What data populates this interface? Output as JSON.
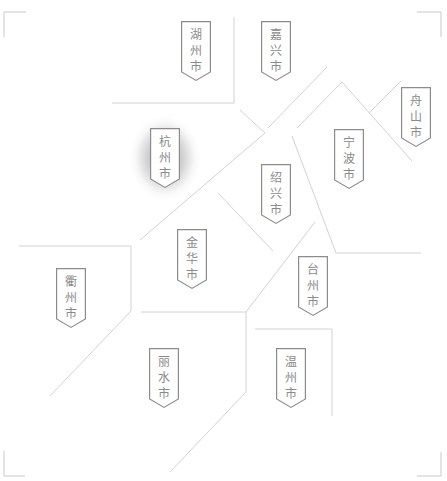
{
  "map": {
    "region": "浙江省",
    "line_color": "#d2d2d2",
    "marker_border_color": "#8c8c8c",
    "label_color": "#8a8a8a",
    "highlighted_city": "杭州市",
    "cities": [
      {
        "id": "huzhou",
        "name": "湖州市",
        "chars": [
          "湖",
          "州",
          "市"
        ],
        "x": 181,
        "y": 21,
        "highlight": false
      },
      {
        "id": "jiaxing",
        "name": "嘉兴市",
        "chars": [
          "嘉",
          "兴",
          "市"
        ],
        "x": 261,
        "y": 21,
        "highlight": false
      },
      {
        "id": "zhoushan",
        "name": "舟山市",
        "chars": [
          "舟",
          "山",
          "市"
        ],
        "x": 401,
        "y": 87,
        "highlight": false
      },
      {
        "id": "hangzhou",
        "name": "杭州市",
        "chars": [
          "杭",
          "州",
          "市"
        ],
        "x": 150,
        "y": 128,
        "highlight": true
      },
      {
        "id": "ningbo",
        "name": "宁波市",
        "chars": [
          "宁",
          "波",
          "市"
        ],
        "x": 334,
        "y": 129,
        "highlight": false
      },
      {
        "id": "shaoxing",
        "name": "绍兴市",
        "chars": [
          "绍",
          "兴",
          "市"
        ],
        "x": 261,
        "y": 164,
        "highlight": false
      },
      {
        "id": "jinhua",
        "name": "金华市",
        "chars": [
          "金",
          "华",
          "市"
        ],
        "x": 177,
        "y": 229,
        "highlight": false
      },
      {
        "id": "taizhou",
        "name": "台州市",
        "chars": [
          "台",
          "州",
          "市"
        ],
        "x": 298,
        "y": 256,
        "highlight": false
      },
      {
        "id": "quzhou",
        "name": "衢州市",
        "chars": [
          "衢",
          "州",
          "市"
        ],
        "x": 56,
        "y": 268,
        "highlight": false
      },
      {
        "id": "lishui",
        "name": "丽水市",
        "chars": [
          "丽",
          "水",
          "市"
        ],
        "x": 149,
        "y": 348,
        "highlight": false
      },
      {
        "id": "wenzhou",
        "name": "温州市",
        "chars": [
          "温",
          "州",
          "市"
        ],
        "x": 276,
        "y": 348,
        "highlight": false
      }
    ]
  }
}
